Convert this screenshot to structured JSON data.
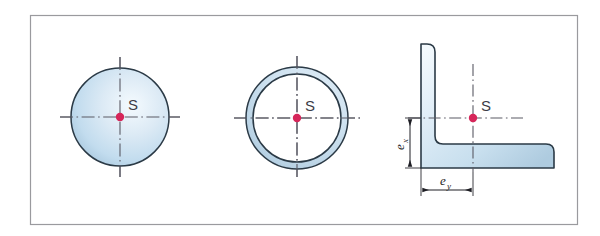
{
  "plate": {
    "background_color": "#ffffff",
    "frame_color": "#9a9a9e",
    "frame": {
      "x": 30,
      "y": 15,
      "width": 548,
      "height": 210
    }
  },
  "style": {
    "outline_color": "#2b3a46",
    "fill_light": "#eef5fb",
    "fill_mid": "#cfe2f0",
    "fill_deep": "#a9c8de",
    "centerline_color": "#5a5a64",
    "centroid_marker_color": "#d6265a",
    "dimension_color": "#1e1e24",
    "label_color": "#3c3c46"
  },
  "figures": [
    {
      "id": "solid-circle",
      "name": "solid-circle-section",
      "centroid_label": "S",
      "center": {
        "x": 120,
        "y": 117
      },
      "outer_radius": 49,
      "centroid_marker_radius": 4.2
    },
    {
      "id": "annulus",
      "name": "hollow-circular-section",
      "centroid_label": "S",
      "center": {
        "x": 297,
        "y": 118
      },
      "outer_radius": 51,
      "inner_radius": 44,
      "centroid_marker_radius": 4.2
    },
    {
      "id": "angle-section",
      "name": "l-angle-section",
      "centroid_label": "S",
      "centroid": {
        "x": 473,
        "y": 118
      },
      "centroid_marker_radius": 4.2,
      "dimensions": [
        {
          "name": "e_x",
          "base": "e",
          "subscript": "x",
          "orientation": "vertical"
        },
        {
          "name": "e_y",
          "base": "e",
          "subscript": "y",
          "orientation": "horizontal"
        }
      ]
    }
  ]
}
